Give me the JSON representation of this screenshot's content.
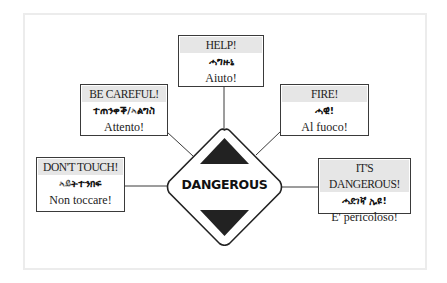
{
  "diagram": {
    "center": {
      "label": "DANGEROUS",
      "shape": "diamond",
      "fill_color": "#ffffff",
      "triangle_color": "#222222"
    },
    "nodes": [
      {
        "id": "help",
        "english": "HELP!",
        "amharic": "ሓግዙኒ",
        "italian": "Aiuto!"
      },
      {
        "id": "be-careful",
        "english": "BE CAREFUL!",
        "amharic": "ተጠንቀቕ/ኣልግስ",
        "italian": "Attento!"
      },
      {
        "id": "fire",
        "english": "FIRE!",
        "amharic": "ሓዊ!",
        "italian": "Al fuoco!"
      },
      {
        "id": "dont-touch",
        "english": "DON'T TOUCH!",
        "amharic": "ኣይትተንክፍ",
        "italian": "Non toccare!"
      },
      {
        "id": "its-dangerous",
        "english": "IT'S DANGEROUS!",
        "amharic": "ሓደገኛ ኢዩ!",
        "italian": "E' pericoloso!"
      }
    ],
    "edges": [
      {
        "from": "help",
        "to": "center"
      },
      {
        "from": "be-careful",
        "to": "center"
      },
      {
        "from": "fire",
        "to": "center"
      },
      {
        "from": "dont-touch",
        "to": "center"
      },
      {
        "from": "its-dangerous",
        "to": "center"
      }
    ],
    "colors": {
      "border": "#3a3a3a",
      "header_band": "#e6e6e6",
      "frame": "#ececec"
    }
  }
}
